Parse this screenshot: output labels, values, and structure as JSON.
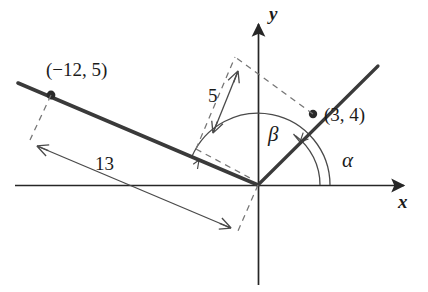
{
  "figure": {
    "background_color": "#ffffff",
    "ink_color": "#262626",
    "thin_color": "#4a4a4a",
    "dash_color": "#6b6b6b"
  },
  "axes": {
    "x_label": "x",
    "y_label": "y",
    "origin": {
      "x": 258,
      "y": 185
    },
    "x_start": {
      "x": 15,
      "y": 185
    },
    "x_end": {
      "x": 412,
      "y": 185
    },
    "y_start": {
      "x": 258,
      "y": 285
    },
    "y_end": {
      "x": 258,
      "y": 14
    }
  },
  "points": [
    {
      "name": "point-neg12-5",
      "label": "(−12, 5)",
      "coords": {
        "x": -12,
        "y": 5
      },
      "pixel": {
        "x": 51,
        "y": 95
      }
    },
    {
      "name": "point-3-4",
      "label": "(3, 4)",
      "coords": {
        "x": 3,
        "y": 4
      },
      "pixel": {
        "x": 313,
        "y": 114
      }
    }
  ],
  "rays": [
    {
      "name": "terminal-ray-beta",
      "from": {
        "x": 258,
        "y": 185
      },
      "to": {
        "x": 18,
        "y": 83
      }
    },
    {
      "name": "terminal-ray-alpha",
      "from": {
        "x": 258,
        "y": 185
      },
      "to": {
        "x": 378,
        "y": 66
      }
    }
  ],
  "angles": [
    {
      "name": "angle-alpha",
      "label": "α",
      "arc_radius": 62,
      "start_deg": 0,
      "end_deg": 53
    },
    {
      "name": "angle-beta",
      "label": "β",
      "arc_radius": 72,
      "start_deg": 0,
      "end_deg": 157
    }
  ],
  "measurements": [
    {
      "name": "measure-5",
      "label": "5",
      "value": 5,
      "describes": "distance from origin to point (3, 4)"
    },
    {
      "name": "measure-13",
      "label": "13",
      "value": 13,
      "describes": "distance from origin to point (−12, 5)"
    }
  ]
}
